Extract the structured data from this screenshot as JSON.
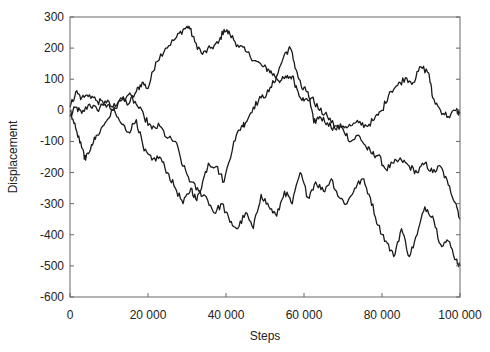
{
  "chart_data": {
    "type": "line",
    "title": "",
    "xlabel": "Steps",
    "ylabel": "Displacement",
    "xlim": [
      0,
      100000
    ],
    "ylim": [
      -600,
      300
    ],
    "xticks": [
      0,
      20000,
      40000,
      60000,
      80000,
      100000
    ],
    "xtick_labels": [
      "0",
      "20 000",
      "40 000",
      "60 000",
      "80 000",
      "100 000"
    ],
    "yticks": [
      300,
      200,
      100,
      0,
      -100,
      -200,
      -300,
      -400,
      -500,
      -600
    ],
    "ytick_labels": [
      "300",
      "200",
      "100",
      "0",
      "-100",
      "-200",
      "-300",
      "-400",
      "-500",
      "-600"
    ],
    "grid": false,
    "legend": null,
    "line_color": "#1a1a1a",
    "series": [
      {
        "name": "walk-1",
        "x": [
          0,
          1500,
          3000,
          5000,
          7000,
          9000,
          11000,
          13000,
          15000,
          17000,
          18500,
          20000,
          22000,
          24500,
          27000,
          29000,
          30500,
          32000,
          34000,
          36000,
          38000,
          39500,
          41000,
          43000,
          45000,
          47500,
          49500,
          51000,
          52500,
          54000,
          55500,
          57000,
          58500,
          60000,
          62000,
          64000,
          66000,
          68000,
          70000,
          72000,
          74000,
          76000,
          77500,
          79000,
          81000,
          83000,
          85000,
          87000,
          89000,
          91000,
          93000,
          95000,
          97000,
          99000,
          100000
        ],
        "y": [
          -20,
          10,
          -10,
          20,
          0,
          30,
          10,
          40,
          20,
          60,
          90,
          70,
          155,
          200,
          230,
          260,
          270,
          220,
          180,
          200,
          215,
          260,
          245,
          210,
          190,
          160,
          140,
          130,
          110,
          95,
          105,
          110,
          60,
          30,
          40,
          0,
          -20,
          -50,
          -60,
          -100,
          -80,
          -120,
          -140,
          -145,
          -190,
          -170,
          -160,
          -180,
          -200,
          -170,
          -200,
          -180,
          -240,
          -300,
          -350
        ]
      },
      {
        "name": "walk-2",
        "x": [
          0,
          1500,
          3000,
          5000,
          7000,
          9000,
          11000,
          13000,
          15000,
          17000,
          19000,
          21000,
          23000,
          25000,
          27000,
          29000,
          31000,
          32500,
          34000,
          35500,
          37500,
          39500,
          42000,
          44000,
          45000,
          47000,
          49000,
          51000,
          53000,
          55000,
          56500,
          58000,
          59500,
          61000,
          62500,
          64000,
          66000,
          68000,
          70000,
          72000,
          74000,
          76000,
          78000,
          80000,
          82000,
          84000,
          86000,
          88000,
          90000,
          92000,
          93000,
          95000,
          97000,
          99000,
          100000
        ],
        "y": [
          10,
          60,
          40,
          50,
          30,
          20,
          0,
          -40,
          -70,
          -30,
          -130,
          -160,
          -150,
          -200,
          -250,
          -300,
          -250,
          -290,
          -230,
          -170,
          -180,
          -230,
          -100,
          -50,
          -40,
          10,
          40,
          60,
          110,
          180,
          200,
          130,
          70,
          60,
          -40,
          -20,
          -40,
          -60,
          -50,
          -50,
          -40,
          -50,
          -30,
          0,
          60,
          80,
          105,
          90,
          140,
          120,
          40,
          0,
          -20,
          0,
          -10
        ]
      },
      {
        "name": "walk-3",
        "x": [
          0,
          1500,
          3000,
          4000,
          5500,
          7000,
          9000,
          11000,
          13000,
          15000,
          17000,
          19000,
          21000,
          23000,
          25000,
          27000,
          29000,
          31000,
          33000,
          35000,
          37000,
          39000,
          41000,
          43000,
          45000,
          47000,
          49000,
          51000,
          53000,
          55000,
          57000,
          59000,
          61000,
          63000,
          65000,
          67000,
          69000,
          71000,
          73000,
          75000,
          77000,
          79000,
          81000,
          83000,
          85000,
          87000,
          89000,
          91000,
          93000,
          95000,
          97000,
          99000,
          100000
        ],
        "y": [
          0,
          -60,
          -120,
          -160,
          -110,
          -80,
          -40,
          0,
          30,
          50,
          20,
          -20,
          -60,
          -50,
          -90,
          -100,
          -180,
          -230,
          -260,
          -280,
          -330,
          -300,
          -360,
          -380,
          -330,
          -380,
          -270,
          -310,
          -340,
          -260,
          -300,
          -200,
          -280,
          -230,
          -260,
          -220,
          -280,
          -300,
          -250,
          -220,
          -280,
          -370,
          -420,
          -470,
          -380,
          -470,
          -400,
          -310,
          -340,
          -430,
          -420,
          -480,
          -500
        ]
      }
    ]
  }
}
